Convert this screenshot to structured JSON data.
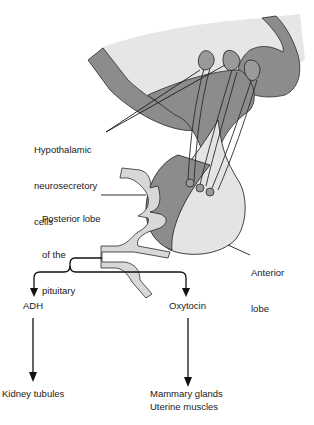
{
  "diagram": {
    "labels": {
      "hypothalamic": [
        "Hypothalamic",
        "neurosecretory",
        "cells"
      ],
      "posterior": [
        "Posterior lobe",
        "of the",
        "pituitary"
      ],
      "anterior": [
        "Anterior",
        "lobe"
      ],
      "adh": "ADH",
      "oxytocin": "Oxytocin",
      "kidney": "Kidney tubules",
      "mammary": "Mammary glands",
      "uterine": "Uterine muscles"
    },
    "colors": {
      "dark_tissue": "#8c8c8c",
      "light_tissue": "#e4e4e4",
      "vessel": "#d8d8d8",
      "outline": "#2a2a2a",
      "text": "#1a1a1a"
    }
  }
}
